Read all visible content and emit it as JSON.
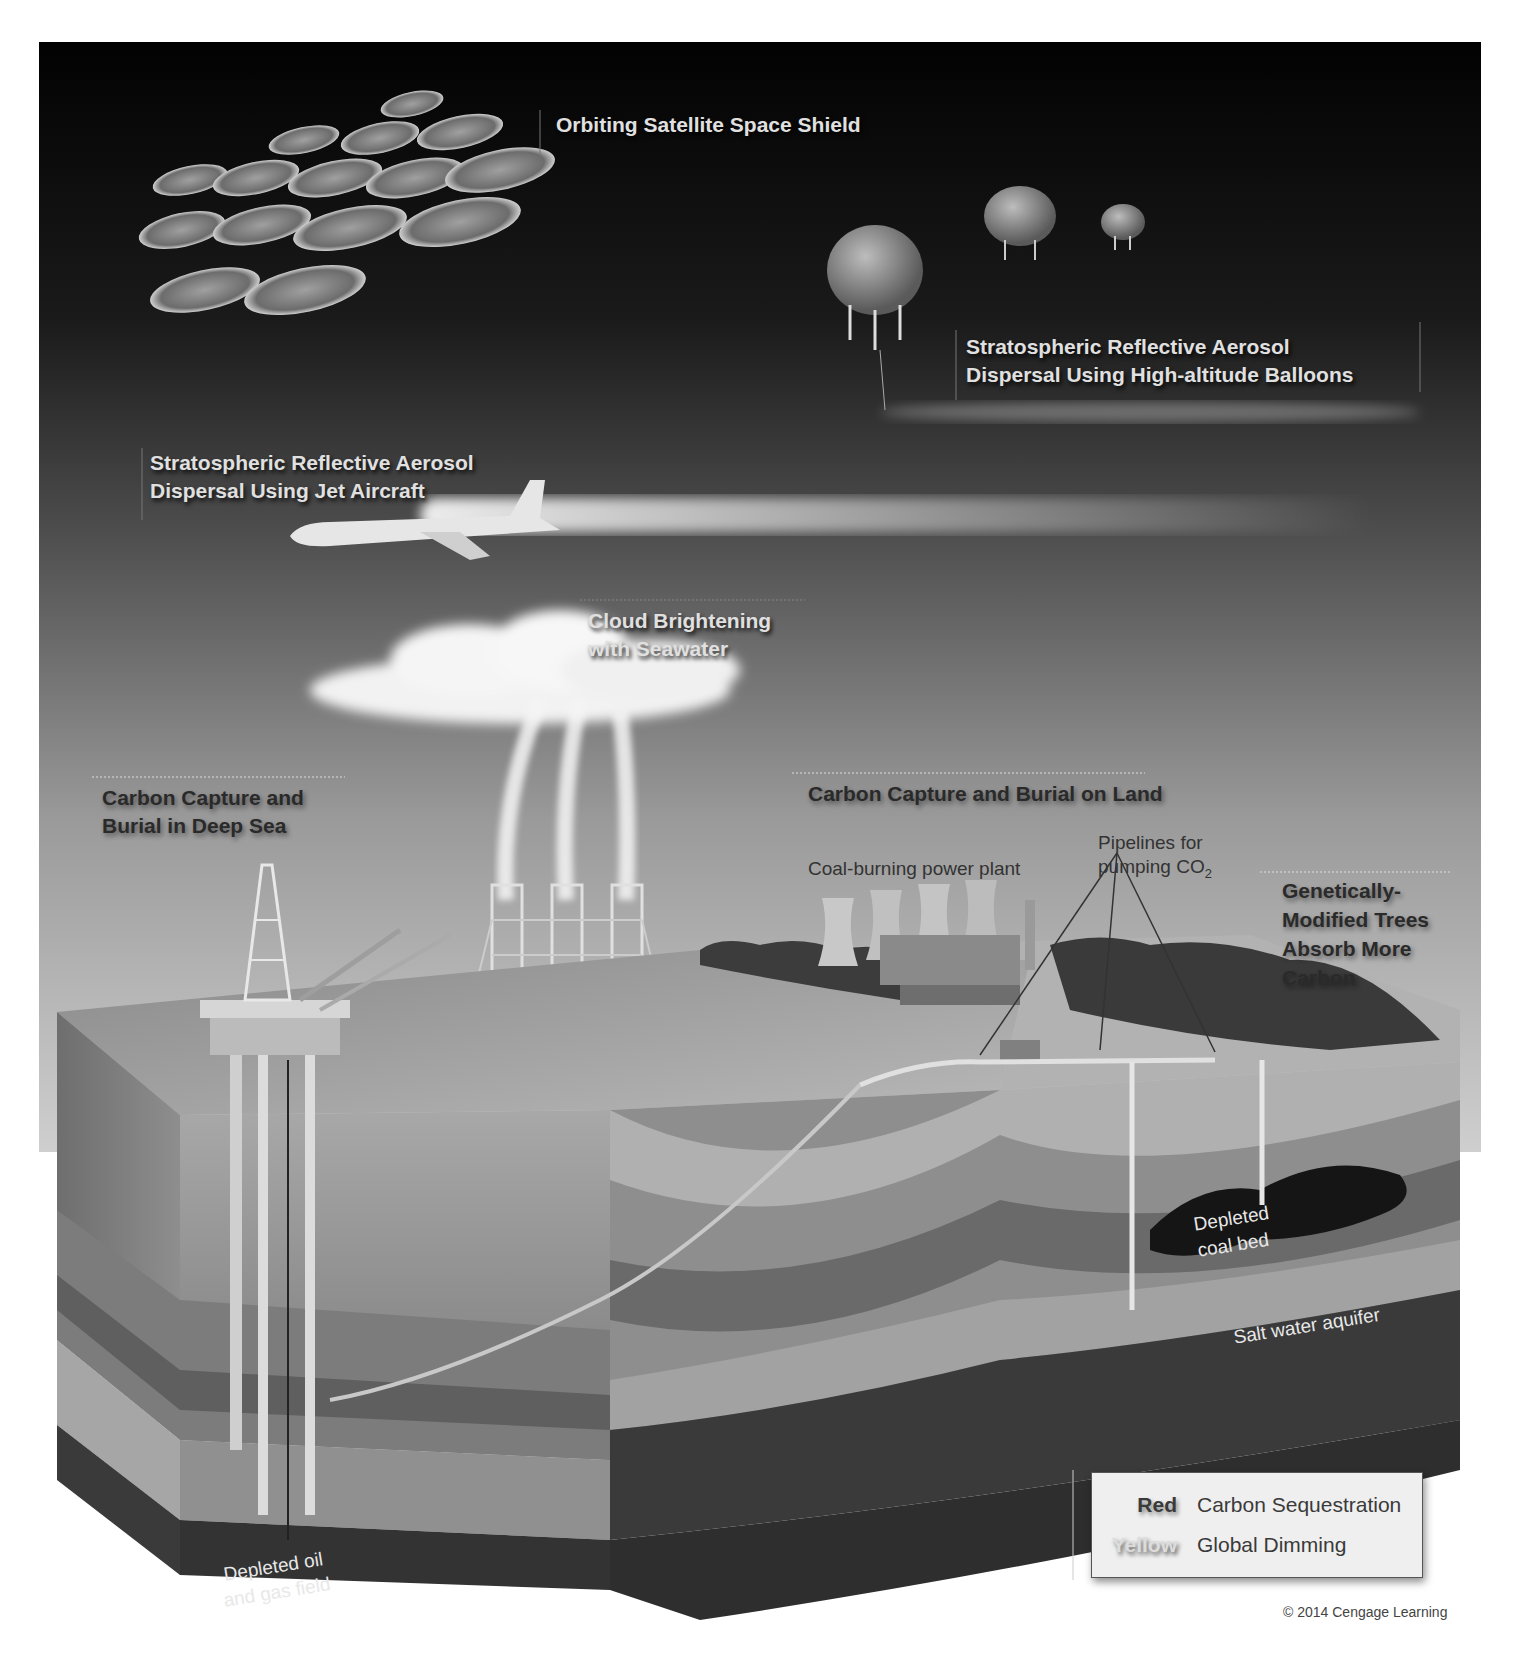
{
  "diagram": {
    "labels": {
      "space_shield": "Orbiting Satellite Space Shield",
      "balloons_line1": "Stratospheric Reflective Aerosol",
      "balloons_line2": "Dispersal Using High-altitude Balloons",
      "jet_line1": "Stratospheric Reflective Aerosol",
      "jet_line2": "Dispersal Using Jet Aircraft",
      "cloud_line1": "Cloud Brightening",
      "cloud_line2": "with Seawater",
      "deep_sea_line1": "Carbon Capture and",
      "deep_sea_line2": "Burial in Deep Sea",
      "land": "Carbon Capture and Burial on Land",
      "power_plant": "Coal-burning power plant",
      "pipelines_line1": "Pipelines for",
      "pipelines_line2": "pumping CO",
      "pipelines_subscript": "2",
      "trees_line1": "Genetically-",
      "trees_line2": "Modified Trees",
      "trees_line3": "Absorb More",
      "trees_line4": "Carbon",
      "coal_bed_line1": "Depleted",
      "coal_bed_line2": "coal bed",
      "aquifer": "Salt water aquifer",
      "oil_field_line1": "Depleted oil",
      "oil_field_line2": "and gas field"
    },
    "legend": {
      "items": [
        {
          "key": "Red",
          "meaning": "Carbon Sequestration",
          "color": "#c0392b"
        },
        {
          "key": "Yellow",
          "meaning": "Global Dimming",
          "color": "#f1c40f"
        }
      ]
    },
    "copyright": "© 2014 Cengage Learning"
  }
}
